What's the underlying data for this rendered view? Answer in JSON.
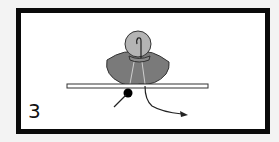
{
  "diagram": {
    "step_number": "3",
    "colors": {
      "frame": "#0a0a0a",
      "background": "#ffffff",
      "page": "#f3f3f3",
      "fan_shape": "#7a7a7a",
      "circle": "#b4b4b4",
      "dot": "#000000",
      "line": "#222222"
    },
    "elements": [
      "gray-fan-shape",
      "light-gray-circle-with-hook",
      "horizontal-bar",
      "black-dot-with-line",
      "curved-arrow"
    ]
  }
}
